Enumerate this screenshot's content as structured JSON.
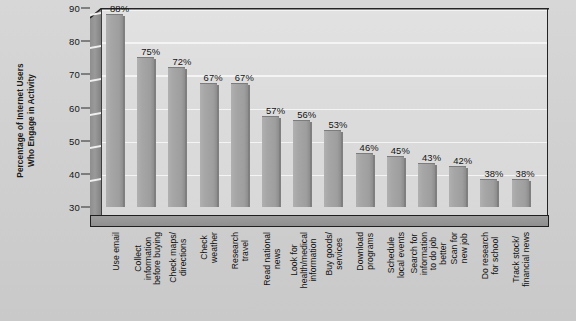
{
  "chart_data": {
    "type": "bar",
    "title": "",
    "subtitle": "",
    "xlabel": "",
    "ylabel": "Percentage of Internet Users Who Engage in Activity",
    "ylabel_lines": [
      "Percentage of Internet Users",
      "Who Engage in Activity"
    ],
    "ylim": [
      30,
      90
    ],
    "yticks": [
      30,
      40,
      50,
      60,
      70,
      80,
      90
    ],
    "ytick_labels": [
      "30",
      "40",
      "50",
      "60",
      "70",
      "80",
      "90"
    ],
    "grid": true,
    "legend": "none",
    "value_suffix": "%",
    "categories": [
      "Use email",
      "Collect information before buying",
      "Check maps/directions",
      "Check weather",
      "Research travel",
      "Read national news",
      "Look for health/medical information",
      "Buy goods/services",
      "Download programs",
      "Schedule local events",
      "Search for information to do job better",
      "Scan for new job",
      "Do research for school",
      "Track stock/financial news"
    ],
    "category_lines": [
      [
        "Use email"
      ],
      [
        "Collect",
        "information",
        "before buying"
      ],
      [
        "Check maps/",
        "directions"
      ],
      [
        "Check",
        "weather"
      ],
      [
        "Research",
        "travel"
      ],
      [
        "Read national",
        "news"
      ],
      [
        "Look for",
        "health/medical",
        "information"
      ],
      [
        "Buy goods/",
        "services"
      ],
      [
        "Download",
        "programs"
      ],
      [
        "Schedule",
        "local events"
      ],
      [
        "Search for",
        "information",
        "to do job",
        "better"
      ],
      [
        "Scan for",
        "new job"
      ],
      [
        "Do research",
        "for school"
      ],
      [
        "Track stock/",
        "financial news"
      ]
    ],
    "values": [
      88,
      75,
      72,
      67,
      67,
      57,
      56,
      53,
      46,
      45,
      43,
      42,
      38,
      38
    ],
    "value_labels": [
      "88%",
      "75%",
      "72%",
      "67%",
      "67%",
      "57%",
      "56%",
      "53%",
      "46%",
      "45%",
      "43%",
      "42%",
      "38%",
      "38%"
    ],
    "colors": {
      "bar": "#a6a6a6",
      "bar_edge": "#7f7f7f",
      "plot_background": "#dcdcdc",
      "page_background": "#d2d2d2",
      "gridline": "#f4f4f4",
      "axis": "#242424",
      "text": "#131313",
      "floor": "#949494"
    }
  }
}
